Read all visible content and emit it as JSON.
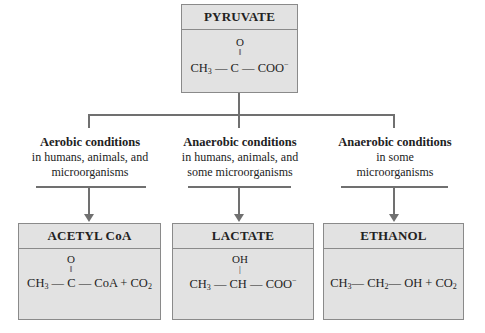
{
  "pyruvate": {
    "title": "PYRUVATE",
    "formula_top": "O",
    "formula_bond": "‖",
    "formula_left": "CH",
    "formula_left_sub": "3",
    "formula_mid": "C",
    "formula_right": "COO",
    "formula_right_sup": "−"
  },
  "conditions": [
    {
      "title": "Aerobic conditions",
      "line1": "in humans, animals, and",
      "line2": "microorganisms"
    },
    {
      "title": "Anaerobic conditions",
      "line1": "in humans, animals, and",
      "line2": "some microorganisms"
    },
    {
      "title": "Anaerobic conditions",
      "line1": "in some",
      "line2": "microorganisms"
    }
  ],
  "products": [
    {
      "title": "ACETYL CoA",
      "above": "O",
      "bond": "‖",
      "formula_a": "CH",
      "sub_a": "3",
      "formula_b": "C",
      "formula_c": "CoA + CO",
      "sub_c": "2"
    },
    {
      "title": "LACTATE",
      "above": "OH",
      "bond": "|",
      "formula_a": "CH",
      "sub_a": "3",
      "formula_b": "CH",
      "formula_c": "COO",
      "sup_c": "−"
    },
    {
      "title": "ETHANOL",
      "formula_a": "CH",
      "sub_a": "3",
      "formula_b": "CH",
      "sub_b": "2",
      "formula_c": "OH + CO",
      "sub_c": "2"
    }
  ],
  "dash": "—"
}
